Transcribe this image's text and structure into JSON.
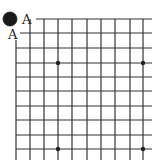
{
  "diagram": {
    "type": "go-board-corner",
    "grid": {
      "columns": 10,
      "rows": 10,
      "x_lines": [
        16,
        30,
        44,
        58,
        72,
        87,
        101,
        115,
        130,
        143
      ],
      "y_lines": [
        19,
        33,
        48,
        63,
        77,
        91,
        106,
        120,
        135,
        149
      ],
      "line_right_end": 152,
      "line_bottom_end": 160,
      "line_color": "#333333"
    },
    "star_points": [
      {
        "x": 58,
        "y": 63
      },
      {
        "x": 143,
        "y": 63
      },
      {
        "x": 58,
        "y": 149
      },
      {
        "x": 143,
        "y": 149
      }
    ],
    "stones": [
      {
        "color": "black",
        "x": 10,
        "y": 19,
        "r": 7
      }
    ],
    "labels": [
      {
        "text": "A",
        "x": 22,
        "y": 24
      },
      {
        "text": "A",
        "x": 8,
        "y": 39
      }
    ]
  }
}
